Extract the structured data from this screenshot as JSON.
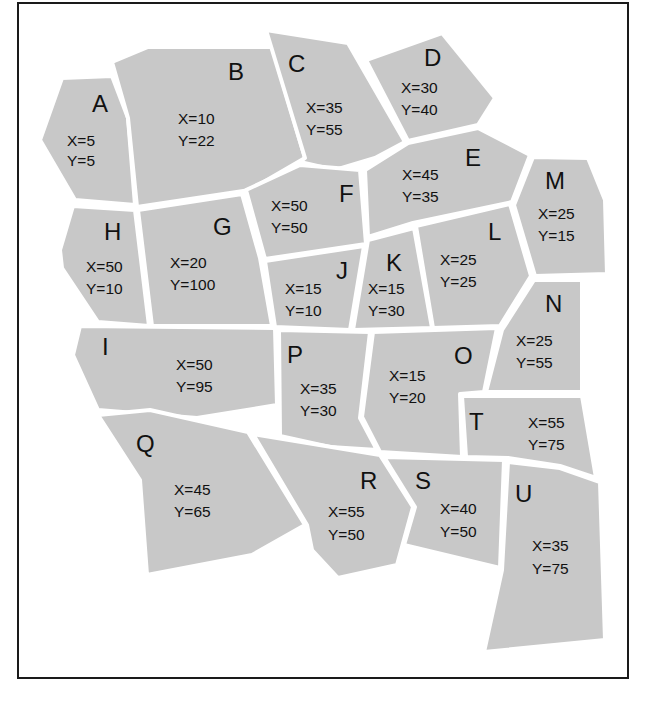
{
  "diagram": {
    "type": "region-map",
    "fill_color": "#c8c8c8",
    "border_color": "#1a1a1a",
    "regions": [
      {
        "id": "A",
        "x_label": "X=5",
        "y_label": "Y=5",
        "x": 5,
        "y": 5
      },
      {
        "id": "B",
        "x_label": "X=10",
        "y_label": "Y=22",
        "x": 10,
        "y": 22
      },
      {
        "id": "C",
        "x_label": "X=35",
        "y_label": "Y=55",
        "x": 35,
        "y": 55
      },
      {
        "id": "D",
        "x_label": "X=30",
        "y_label": "Y=40",
        "x": 30,
        "y": 40
      },
      {
        "id": "E",
        "x_label": "X=45",
        "y_label": "Y=35",
        "x": 45,
        "y": 35
      },
      {
        "id": "F",
        "x_label": "X=50",
        "y_label": "Y=50",
        "x": 50,
        "y": 50
      },
      {
        "id": "G",
        "x_label": "X=20",
        "y_label": "Y=100",
        "x": 20,
        "y": 100
      },
      {
        "id": "H",
        "x_label": "X=50",
        "y_label": "Y=10",
        "x": 50,
        "y": 10
      },
      {
        "id": "I",
        "x_label": "X=50",
        "y_label": "Y=95",
        "x": 50,
        "y": 95
      },
      {
        "id": "J",
        "x_label": "X=15",
        "y_label": "Y=10",
        "x": 15,
        "y": 10
      },
      {
        "id": "K",
        "x_label": "X=15",
        "y_label": "Y=30",
        "x": 15,
        "y": 30
      },
      {
        "id": "L",
        "x_label": "X=25",
        "y_label": "Y=25",
        "x": 25,
        "y": 25
      },
      {
        "id": "M",
        "x_label": "X=25",
        "y_label": "Y=15",
        "x": 25,
        "y": 15
      },
      {
        "id": "N",
        "x_label": "X=25",
        "y_label": "Y=55",
        "x": 25,
        "y": 55
      },
      {
        "id": "O",
        "x_label": "X=15",
        "y_label": "Y=20",
        "x": 15,
        "y": 20
      },
      {
        "id": "P",
        "x_label": "X=35",
        "y_label": "Y=30",
        "x": 35,
        "y": 30
      },
      {
        "id": "Q",
        "x_label": "X=45",
        "y_label": "Y=65",
        "x": 45,
        "y": 65
      },
      {
        "id": "R",
        "x_label": "X=55",
        "y_label": "Y=50",
        "x": 55,
        "y": 50
      },
      {
        "id": "S",
        "x_label": "X=40",
        "y_label": "Y=50",
        "x": 40,
        "y": 50
      },
      {
        "id": "T",
        "x_label": "X=55",
        "y_label": "Y=75",
        "x": 55,
        "y": 75
      },
      {
        "id": "U",
        "x_label": "X=35",
        "y_label": "Y=75",
        "x": 35,
        "y": 75
      }
    ]
  }
}
